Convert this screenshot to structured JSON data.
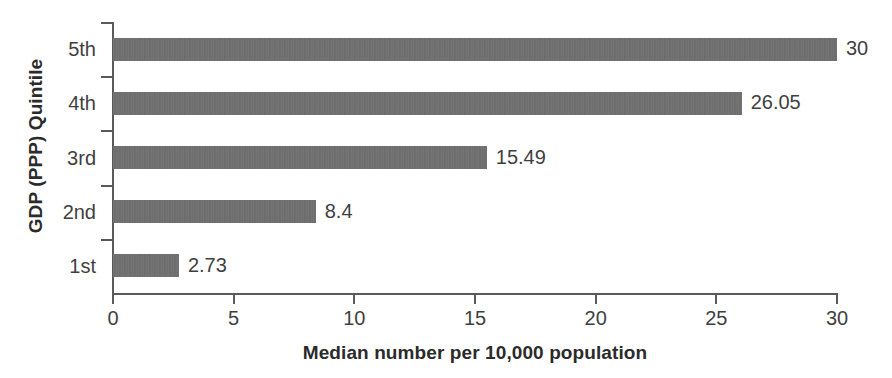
{
  "chart_data": {
    "type": "bar",
    "orientation": "horizontal",
    "title": "",
    "xlabel": "Median number per 10,000 population",
    "ylabel": "GDP (PPP) Quintile",
    "categories": [
      "1st",
      "2nd",
      "3rd",
      "4th",
      "5th"
    ],
    "values": [
      2.73,
      8.4,
      15.49,
      26.05,
      30
    ],
    "value_labels": [
      "2.73",
      "8.4",
      "15.49",
      "26.05",
      "30"
    ],
    "xlim": [
      0,
      30
    ],
    "xticks": [
      0,
      5,
      10,
      15,
      20,
      25,
      30
    ],
    "xtick_labels": [
      "0",
      "5",
      "10",
      "15",
      "20",
      "25",
      "30"
    ],
    "grid": false,
    "legend": false,
    "bar_color": "#6e6e6e",
    "axis_color": "#5a5a5a",
    "text_color": "#3f3f3f",
    "category_order_top_to_bottom": [
      "5th",
      "4th",
      "3rd",
      "2nd",
      "1st"
    ],
    "bars_top_to_bottom": [
      {
        "category": "5th",
        "value": 30,
        "label": "30"
      },
      {
        "category": "4th",
        "value": 26.05,
        "label": "26.05"
      },
      {
        "category": "3rd",
        "value": 15.49,
        "label": "15.49"
      },
      {
        "category": "2nd",
        "value": 8.4,
        "label": "8.4"
      },
      {
        "category": "1st",
        "value": 2.73,
        "label": "2.73"
      }
    ]
  }
}
